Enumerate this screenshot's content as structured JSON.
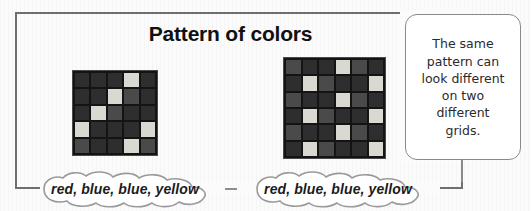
{
  "page": {
    "title": "Pattern of colors"
  },
  "callout": {
    "name": "same-pattern-note",
    "text": "The same\npattern can\nlook different\non two\ndifferent\ngrids."
  },
  "clouds": [
    {
      "label": "red, blue, blue, yellow"
    },
    {
      "label": "red, blue, blue, yellow"
    }
  ],
  "colors": {
    "dark": "#2e2e2e",
    "medium": "#4a4a4a",
    "light": "#d9d9d2",
    "gridline": "#141414",
    "frame": "#6f6f6f",
    "note_border": "#8a8a8a",
    "text": "#1b1b1b"
  },
  "chart_data": {
    "type": "heatmap",
    "title": "Pattern of colors",
    "xlabel": "",
    "ylabel": "",
    "grid": true,
    "legend": "none",
    "annotations": [
      "The same pattern can look different on two different grids."
    ],
    "value_labels": {
      "d": "dark",
      "m": "medium",
      "l": "light"
    },
    "panels": [
      {
        "name": "left-grid",
        "rows": 5,
        "cols": 5,
        "sequence": "red, blue, blue, yellow",
        "cells": [
          [
            "d",
            "d",
            "d",
            "l",
            "d"
          ],
          [
            "d",
            "d",
            "l",
            "m",
            "d"
          ],
          [
            "d",
            "l",
            "m",
            "d",
            "d"
          ],
          [
            "l",
            "d",
            "d",
            "d",
            "l"
          ],
          [
            "m",
            "d",
            "d",
            "l",
            "m"
          ]
        ]
      },
      {
        "name": "right-grid",
        "rows": 6,
        "cols": 6,
        "sequence": "red, blue, blue, yellow",
        "cells": [
          [
            "m",
            "d",
            "d",
            "l",
            "m",
            "d"
          ],
          [
            "d",
            "l",
            "m",
            "d",
            "d",
            "l"
          ],
          [
            "m",
            "d",
            "d",
            "l",
            "m",
            "d"
          ],
          [
            "d",
            "l",
            "m",
            "d",
            "d",
            "l"
          ],
          [
            "m",
            "d",
            "d",
            "l",
            "m",
            "d"
          ],
          [
            "d",
            "l",
            "m",
            "d",
            "d",
            "l"
          ]
        ]
      }
    ]
  }
}
